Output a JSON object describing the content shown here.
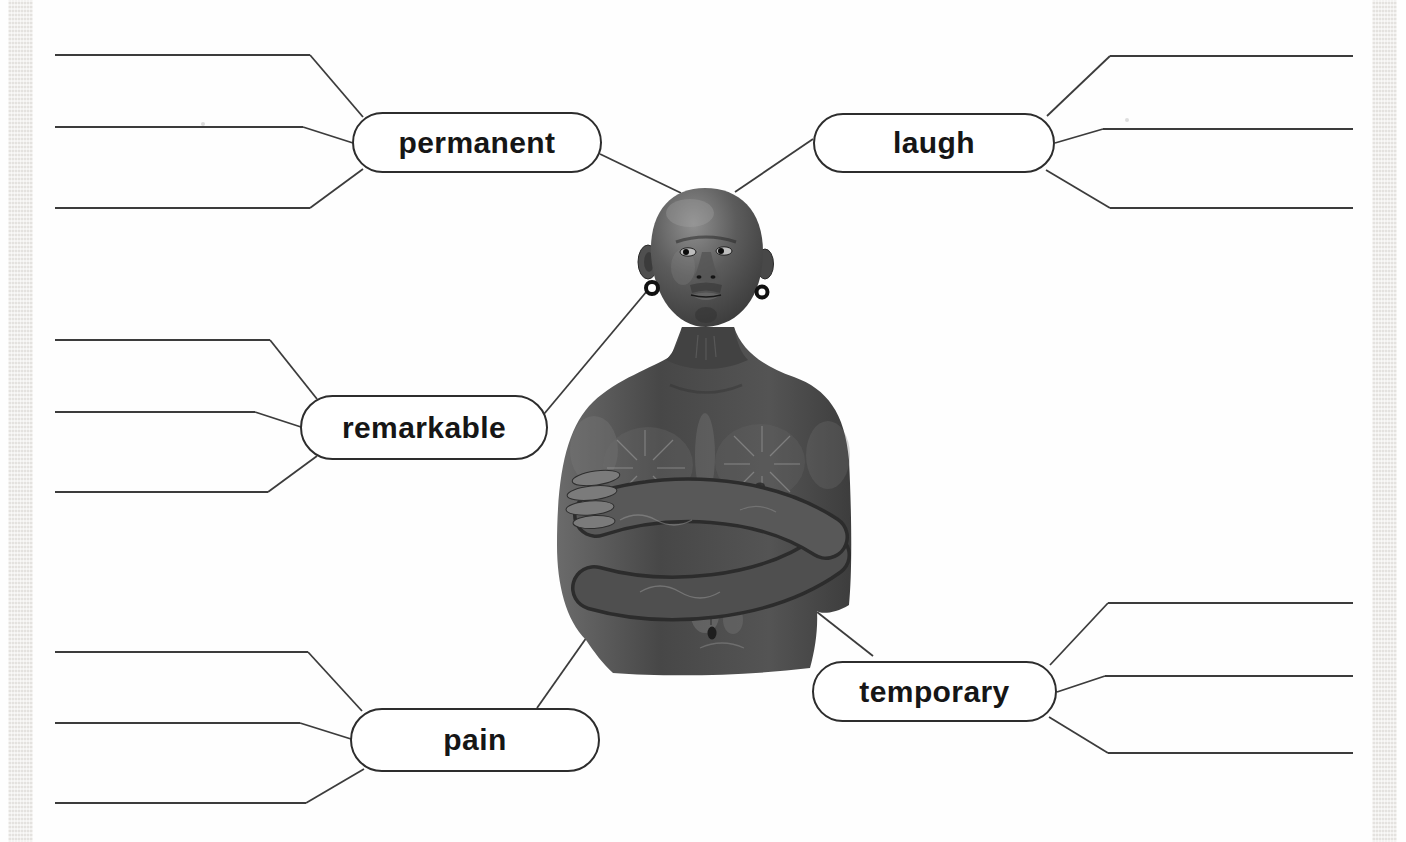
{
  "page": {
    "background": "#fefefe",
    "edge_strip_color": "#ebe9e6",
    "line_color": "#3c3c3c",
    "pill_border_color": "#2d2d2d",
    "label_color": "#161616"
  },
  "diagram": {
    "type": "vocabulary-word-map",
    "center_figure": {
      "description": "Black-and-white photograph of a bald, heavily tattooed man with his arms crossed, wearing dark hoop earrings"
    },
    "nodes": [
      {
        "id": "permanent",
        "label": "permanent",
        "side": "left",
        "blank_lines": 3
      },
      {
        "id": "laugh",
        "label": "laugh",
        "side": "right",
        "blank_lines": 3
      },
      {
        "id": "remarkable",
        "label": "remarkable",
        "side": "left",
        "blank_lines": 3
      },
      {
        "id": "pain",
        "label": "pain",
        "side": "left",
        "blank_lines": 3
      },
      {
        "id": "temporary",
        "label": "temporary",
        "side": "right",
        "blank_lines": 3
      }
    ]
  }
}
